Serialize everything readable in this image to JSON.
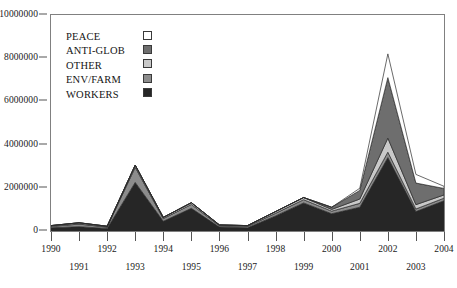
{
  "chart_data": {
    "type": "area",
    "stacked": true,
    "title": "",
    "xlabel": "",
    "ylabel": "",
    "x": [
      1990,
      1991,
      1992,
      1993,
      1994,
      1995,
      1996,
      1997,
      1998,
      1999,
      2000,
      2001,
      2002,
      2003,
      2004
    ],
    "categories": [
      "1990",
      "1991",
      "1992",
      "1993",
      "1994",
      "1995",
      "1996",
      "1997",
      "1998",
      "1999",
      "2000",
      "2001",
      "2002",
      "2003",
      "2004"
    ],
    "series": [
      {
        "name": "WORKERS",
        "color": "#262626",
        "values": [
          150000,
          200000,
          120000,
          2250000,
          450000,
          1050000,
          180000,
          150000,
          700000,
          1300000,
          800000,
          1100000,
          3400000,
          900000,
          1400000
        ]
      },
      {
        "name": "ENV/FARM",
        "color": "#8c8c8c",
        "values": [
          60000,
          120000,
          60000,
          700000,
          120000,
          180000,
          60000,
          60000,
          120000,
          150000,
          120000,
          180000,
          250000,
          120000,
          120000
        ]
      },
      {
        "name": "OTHER",
        "color": "#c9c9c9",
        "values": [
          40000,
          60000,
          40000,
          100000,
          60000,
          80000,
          40000,
          40000,
          80000,
          100000,
          80000,
          200000,
          650000,
          200000,
          150000
        ]
      },
      {
        "name": "ANTI-GLOB",
        "color": "#6e6e6e",
        "values": [
          0,
          0,
          0,
          0,
          0,
          0,
          0,
          0,
          0,
          0,
          100000,
          400000,
          2800000,
          1000000,
          300000
        ]
      },
      {
        "name": "PEACE",
        "color": "#ffffff",
        "values": [
          0,
          0,
          0,
          0,
          0,
          0,
          0,
          0,
          0,
          0,
          0,
          100000,
          1100000,
          400000,
          100000
        ]
      }
    ],
    "totals": [
      250000,
      380000,
      220000,
      3050000,
      630000,
      1310000,
      280000,
      250000,
      900000,
      1550000,
      1100000,
      1980000,
      8200000,
      2620000,
      2070000
    ],
    "ylim": [
      0,
      10000000
    ],
    "yticks": [
      0,
      2000000,
      4000000,
      6000000,
      8000000,
      10000000
    ],
    "ytick_labels": [
      "0",
      "2000000",
      "4000000",
      "6000000",
      "8000000",
      "10000000"
    ],
    "xlim": [
      1990,
      2004
    ],
    "grid": false,
    "legend_position": "upper-left-inside"
  },
  "y_axis": {
    "ticks": [
      {
        "label": "10000000",
        "value": 10000000
      },
      {
        "label": "8000000",
        "value": 8000000
      },
      {
        "label": "6000000",
        "value": 6000000
      },
      {
        "label": "4000000",
        "value": 4000000
      },
      {
        "label": "2000000",
        "value": 2000000
      },
      {
        "label": "0",
        "value": 0
      }
    ]
  },
  "x_axis": {
    "ticks": [
      {
        "label": "1990",
        "value": 1990,
        "row": "top"
      },
      {
        "label": "1991",
        "value": 1991,
        "row": "bottom"
      },
      {
        "label": "1992",
        "value": 1992,
        "row": "top"
      },
      {
        "label": "1993",
        "value": 1993,
        "row": "bottom"
      },
      {
        "label": "1994",
        "value": 1994,
        "row": "top"
      },
      {
        "label": "1995",
        "value": 1995,
        "row": "bottom"
      },
      {
        "label": "1996",
        "value": 1996,
        "row": "top"
      },
      {
        "label": "1997",
        "value": 1997,
        "row": "bottom"
      },
      {
        "label": "1998",
        "value": 1998,
        "row": "top"
      },
      {
        "label": "1999",
        "value": 1999,
        "row": "bottom"
      },
      {
        "label": "2000",
        "value": 2000,
        "row": "top"
      },
      {
        "label": "2001",
        "value": 2001,
        "row": "bottom"
      },
      {
        "label": "2002",
        "value": 2002,
        "row": "top"
      },
      {
        "label": "2003",
        "value": 2003,
        "row": "bottom"
      },
      {
        "label": "2004",
        "value": 2004,
        "row": "top"
      }
    ]
  },
  "legend": {
    "items": [
      {
        "label": "PEACE",
        "color": "#ffffff"
      },
      {
        "label": "ANTI-GLOB",
        "color": "#6e6e6e"
      },
      {
        "label": "OTHER",
        "color": "#c9c9c9"
      },
      {
        "label": "ENV/FARM",
        "color": "#8c8c8c"
      },
      {
        "label": "WORKERS",
        "color": "#262626"
      }
    ]
  },
  "colors": {
    "frame": "#808080",
    "axis_text": "#1a1a1a",
    "background": "#ffffff"
  }
}
